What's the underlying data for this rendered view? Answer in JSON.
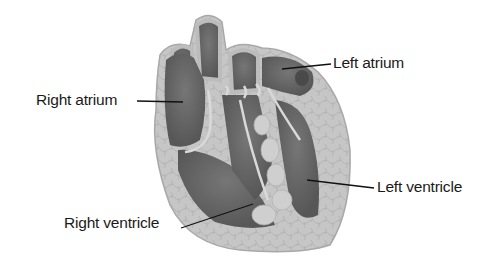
{
  "diagram": {
    "colors": {
      "background": "#ffffff",
      "wall_outer": "#bdbdbd",
      "wall_tissue": "#c9c9c9",
      "chamber": "#6a6a6a",
      "chamber_dark": "#555555",
      "valve": "#d9d9d9",
      "leader_line": "#111111",
      "label_text": "#1a1a1a"
    },
    "labels": [
      {
        "id": "right-atrium",
        "text": "Right atrium",
        "x": 36,
        "y": 92,
        "line": [
          [
            137,
            101
          ],
          [
            183,
            102
          ]
        ]
      },
      {
        "id": "left-atrium",
        "text": "Left atrium",
        "x": 333,
        "y": 55,
        "line": [
          [
            282,
            69
          ],
          [
            331,
            64
          ]
        ]
      },
      {
        "id": "left-ventricle",
        "text": "Left ventricle",
        "x": 377,
        "y": 179,
        "line": [
          [
            307,
            180
          ],
          [
            374,
            188
          ]
        ]
      },
      {
        "id": "right-ventricle",
        "text": "Right ventricle",
        "x": 64,
        "y": 215,
        "line": [
          [
            181,
            228
          ],
          [
            253,
            204
          ]
        ]
      }
    ]
  }
}
